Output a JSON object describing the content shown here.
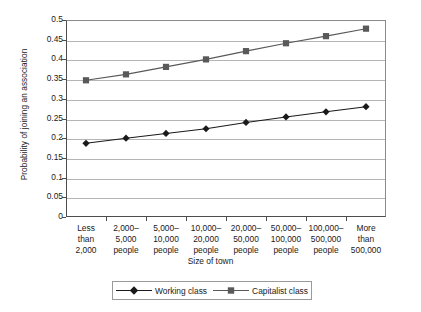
{
  "chart_data": {
    "type": "line",
    "title": "",
    "xlabel": "Size of town",
    "ylabel": "Probability of joining an association",
    "ylim": [
      0,
      0.5
    ],
    "ytick_labels": [
      "0.5",
      "0.45",
      "0.4",
      "0.35",
      "0.3",
      "0.25",
      "0.2",
      "0.15",
      "0.1",
      "0.05",
      "0"
    ],
    "ytick_values": [
      0.5,
      0.45,
      0.4,
      0.35,
      0.3,
      0.25,
      0.2,
      0.15,
      0.1,
      0.05,
      0
    ],
    "grid": true,
    "legend_position": "bottom",
    "categories": [
      "Less\nthan\n2,000",
      "2,000–\n5,000\npeople",
      "5,000–\n10,000\npeople",
      "10,000–\n20,000\npeople",
      "20,000–\n50,000\npeople",
      "50,000–\n100,000\npeople",
      "100,000–\n500,000\npeople",
      "More\nthan\n500,000"
    ],
    "category_lines": [
      [
        "Less",
        "than",
        "2,000"
      ],
      [
        "2,000–",
        "5,000",
        "people"
      ],
      [
        "5,000–",
        "10,000",
        "people"
      ],
      [
        "10,000–",
        "20,000",
        "people"
      ],
      [
        "20,000–",
        "50,000",
        "people"
      ],
      [
        "50,000–",
        "100,000",
        "people"
      ],
      [
        "100,000–",
        "500,000",
        "people"
      ],
      [
        "More",
        "than",
        "500,000"
      ]
    ],
    "series": [
      {
        "name": "Working class",
        "marker": "diamond",
        "color": "#1a1a1a",
        "values": [
          0.187,
          0.2,
          0.212,
          0.224,
          0.24,
          0.254,
          0.267,
          0.28
        ]
      },
      {
        "name": "Capitalist class",
        "marker": "square",
        "color": "#595959",
        "values": [
          0.347,
          0.362,
          0.381,
          0.4,
          0.421,
          0.441,
          0.459,
          0.478
        ]
      }
    ]
  },
  "legend": {
    "entries": [
      {
        "label": "Working class",
        "marker": "diamond"
      },
      {
        "label": "Capitalist class",
        "marker": "square"
      }
    ]
  },
  "colors": {
    "working_class": "#1a1a1a",
    "capitalist_class": "#595959",
    "gridline": "#b5b5b5",
    "axis": "#4d4d4d",
    "background": "#ffffff"
  }
}
